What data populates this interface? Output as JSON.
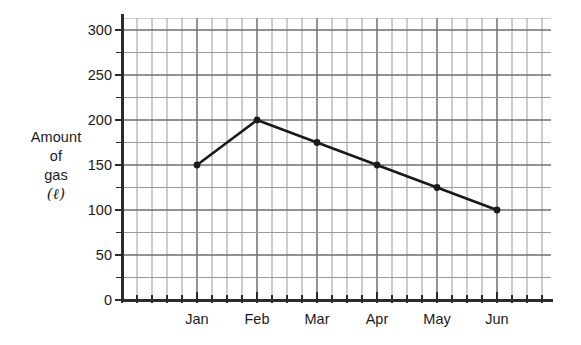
{
  "chart_data": {
    "type": "line",
    "title": "",
    "xlabel": "",
    "ylabel": "Amount of gas (ℓ)",
    "ylabel_lines": [
      "Amount",
      "of",
      "gas",
      "(ℓ)"
    ],
    "categories": [
      "Jan",
      "Feb",
      "Mar",
      "Apr",
      "May",
      "Jun"
    ],
    "values": [
      150,
      200,
      175,
      150,
      125,
      100
    ],
    "series": [
      {
        "name": "Amount of gas",
        "values": [
          150,
          200,
          175,
          150,
          125,
          100
        ]
      }
    ],
    "ylim": [
      0,
      300
    ],
    "xlim_categories": 6,
    "y_ticks_labeled": [
      0,
      50,
      100,
      150,
      200,
      250,
      300
    ],
    "y_tick_labels": [
      "0",
      "50",
      "100",
      "150",
      "200",
      "250",
      "300"
    ],
    "y_minor_tick_step": 25,
    "grid": true,
    "grid_color": "#9a9a9a",
    "grid_major_color": "#6e6e6e",
    "legend": "none",
    "line_color": "#1a1a1a",
    "marker": "circle",
    "marker_color": "#1a1a1a",
    "background": "#ffffff"
  }
}
